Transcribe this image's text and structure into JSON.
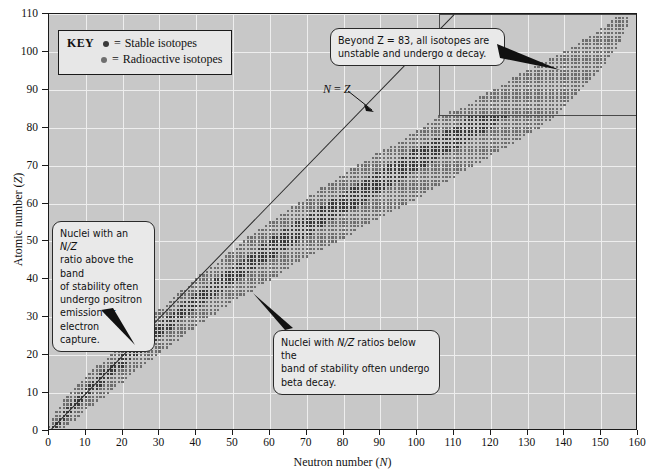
{
  "chart_data": {
    "type": "scatter",
    "title": "",
    "xlabel": "Neutron number (N)",
    "ylabel": "Atomic number (Z)",
    "xlim": [
      0,
      160
    ],
    "ylim": [
      0,
      110
    ],
    "xticks": [
      0,
      10,
      20,
      30,
      40,
      50,
      60,
      70,
      80,
      90,
      100,
      110,
      120,
      130,
      140,
      150,
      160
    ],
    "yticks": [
      0,
      10,
      20,
      30,
      40,
      50,
      60,
      70,
      80,
      90,
      100,
      110
    ],
    "grid": true,
    "legend_position": "top-left",
    "series": [
      {
        "name": "Stable isotopes",
        "marker": "square-dot",
        "color": "#3a3a3a",
        "description": "Dark dots forming the narrow core of the band of stability, following N≈Z at low Z and curving to N≈1.5Z near Z=83."
      },
      {
        "name": "Radioactive isotopes",
        "marker": "square-dot",
        "color": "#6e6e6e",
        "description": "Lighter dots filling the broad band around the stable core, spanning the full belt from (N=0,Z=1) to (N=157,Z=109)."
      }
    ],
    "band_outline": {
      "comment": "Approximate upper and lower N boundaries of the plotted isotope belt, sampled every 5 in Z.",
      "z": [
        1,
        5,
        10,
        15,
        20,
        25,
        30,
        35,
        40,
        45,
        50,
        55,
        60,
        65,
        70,
        75,
        80,
        83,
        85,
        90,
        95,
        100,
        105,
        109
      ],
      "n_lower": [
        0,
        2,
        6,
        11,
        17,
        23,
        28,
        34,
        40,
        47,
        53,
        60,
        68,
        76,
        84,
        93,
        102,
        106,
        112,
        121,
        130,
        140,
        149,
        154
      ],
      "n_upper": [
        4,
        9,
        16,
        22,
        29,
        36,
        43,
        51,
        60,
        68,
        78,
        87,
        97,
        106,
        115,
        124,
        133,
        137,
        139,
        144,
        149,
        153,
        156,
        157
      ]
    },
    "reference_line": {
      "label": "N = Z",
      "equation": "Z = N",
      "from": [
        0,
        0
      ],
      "to": [
        110,
        110
      ]
    },
    "region_box": {
      "label": "Z > 83 region",
      "x_range": [
        106,
        160
      ],
      "y_range": [
        83,
        110
      ]
    }
  },
  "axes": {
    "x": {
      "title_prefix": "Neutron number (",
      "title_italic": "N",
      "title_suffix": ")",
      "labels": [
        "0",
        "10",
        "20",
        "30",
        "40",
        "50",
        "60",
        "70",
        "80",
        "90",
        "100",
        "110",
        "120",
        "130",
        "140",
        "150",
        "160"
      ]
    },
    "y": {
      "title_prefix": "Atomic number (",
      "title_italic": "Z",
      "title_suffix": ")",
      "labels": [
        "0",
        "10",
        "20",
        "30",
        "40",
        "50",
        "60",
        "70",
        "80",
        "90",
        "100",
        "110"
      ]
    }
  },
  "legend": {
    "key_label": "KEY",
    "items": [
      {
        "marker_name": "stable-isotope-swatch",
        "equals": "=",
        "label": "Stable isotopes",
        "color": "#3a3a3a"
      },
      {
        "marker_name": "radioactive-isotope-swatch",
        "equals": "=",
        "label": "Radioactive isotopes",
        "color": "#6e6e6e"
      }
    ]
  },
  "annotations": {
    "alpha_decay": {
      "line1": "Beyond Z = 83, all isotopes are",
      "line2": "unstable and undergo α decay."
    },
    "positron": {
      "text": "Nuclei with an N/Z ratio above the band of stability often undergo positron emission or electron capture.",
      "line1_a": "Nuclei with an ",
      "line1_b": "N/Z",
      "line2": "ratio above the band",
      "line3": "of stability often",
      "line4": "undergo positron",
      "line5": "emission or electron",
      "line6": "capture."
    },
    "beta": {
      "line1_a": "Nuclei with ",
      "line1_b": "N/Z",
      "line1_c": " ratios below the",
      "line2": "band of stability often undergo",
      "line3": "beta decay."
    },
    "nz_line_label": "N = Z"
  },
  "colors": {
    "plot_background": "#c8c8c8",
    "gridline": "#eeeeee",
    "axis": "#1a1a1a",
    "stable": "#3a3a3a",
    "radioactive": "#6e6e6e",
    "callout_background": "#e9e9e9",
    "page_background": "#ffffff"
  }
}
